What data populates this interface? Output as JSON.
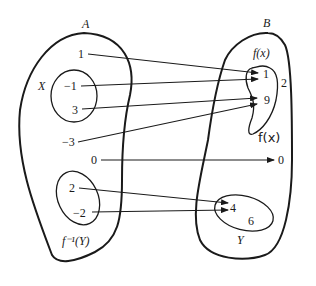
{
  "diagram": {
    "sets": {
      "A": {
        "label": "A"
      },
      "B": {
        "label": "B"
      },
      "X": {
        "label": "X"
      },
      "fX": {
        "label": "f(x)"
      },
      "Y": {
        "label": "Y"
      },
      "finvY": {
        "label": "f⁻¹(Y)"
      },
      "handwritten": {
        "label": "f(x)"
      }
    },
    "domain_elements": [
      "1",
      "−1",
      "3",
      "−3",
      "0",
      "2",
      "−2"
    ],
    "codomain_elements": [
      "1",
      "2",
      "9",
      "0",
      "4",
      "6"
    ],
    "mappings": [
      {
        "from": "1",
        "to": "1"
      },
      {
        "from": "−1",
        "to": "1"
      },
      {
        "from": "3",
        "to": "9"
      },
      {
        "from": "−3",
        "to": "9"
      },
      {
        "from": "0",
        "to": "0"
      },
      {
        "from": "2",
        "to": "4"
      },
      {
        "from": "−2",
        "to": "4"
      }
    ]
  }
}
